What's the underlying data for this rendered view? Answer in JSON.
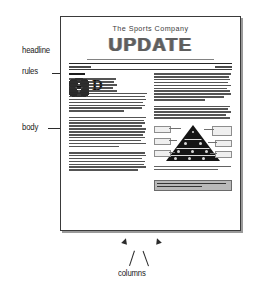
{
  "annotations": [
    {
      "id": "headline",
      "label": "headline"
    },
    {
      "id": "rules",
      "label": "rules"
    },
    {
      "id": "body",
      "label": "body"
    },
    {
      "id": "columns",
      "label": "columns"
    }
  ],
  "page": {
    "masthead": {
      "nameplate": "The Sports Company",
      "headline_word": "UPDATE",
      "tagline": "A Publication for Customers of The Sports Company"
    },
    "dateline": {
      "date": "FALL 1998",
      "volume": "VOLUME 1"
    },
    "left_column": {
      "kicker": "Health",
      "dropcap": "D",
      "paragraph_count": 3
    },
    "right_column": {
      "figure_caption_lines": 2,
      "callout_box_lines": 2
    },
    "figure": {
      "type": "food-pyramid",
      "label_count": 6
    }
  },
  "colors": {
    "ink": "#2b2b2b",
    "page_border": "#3a3a3a",
    "page_shadow": "#9a9a9a",
    "headline_grey": "#5e5e5e",
    "greybox_fill": "#b9b9b9"
  }
}
